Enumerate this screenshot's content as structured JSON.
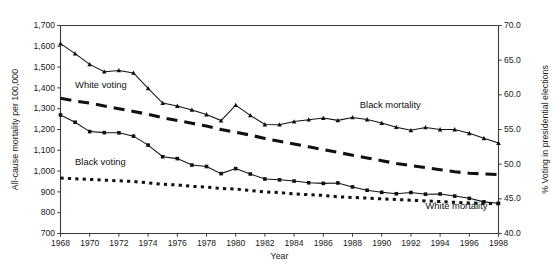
{
  "chart_data": {
    "type": "line",
    "title": "",
    "xlabel": "Year",
    "ylabel": "All-cause mortality per 100,000",
    "y2label": "% Voting in presidential elections",
    "xlim": [
      1968,
      1998
    ],
    "ylim": [
      700,
      1700
    ],
    "y2lim": [
      40.0,
      70.0
    ],
    "grid": false,
    "legend_position": "inline-annotations",
    "x_ticks": [
      1968,
      1970,
      1972,
      1974,
      1976,
      1978,
      1980,
      1982,
      1984,
      1986,
      1988,
      1990,
      1992,
      1994,
      1996,
      1998
    ],
    "x_tick_labels": [
      "1968",
      "1970",
      "1972",
      "1974",
      "1976",
      "1978",
      "1980",
      "1982",
      "1984",
      "1986",
      "1988",
      "1990",
      "1992",
      "1994",
      "1996",
      "1998"
    ],
    "y_ticks": [
      700,
      800,
      900,
      1000,
      1100,
      1200,
      1300,
      1400,
      1500,
      1600,
      1700
    ],
    "y_tick_labels": [
      "700",
      "800",
      "900",
      "1,000",
      "1,100",
      "1,200",
      "1,300",
      "1,400",
      "1,500",
      "1,600",
      "1,700"
    ],
    "y2_ticks": [
      40.0,
      45.0,
      50.0,
      55.0,
      60.0,
      65.0,
      70.0
    ],
    "y2_tick_labels": [
      "40.0",
      "45.0",
      "50.0",
      "55.0",
      "60.0",
      "65.0",
      "70.0"
    ],
    "x": [
      1968,
      1969,
      1970,
      1971,
      1972,
      1973,
      1974,
      1975,
      1976,
      1977,
      1978,
      1979,
      1980,
      1981,
      1982,
      1983,
      1984,
      1985,
      1986,
      1987,
      1988,
      1989,
      1990,
      1991,
      1992,
      1993,
      1994,
      1995,
      1996,
      1997,
      1998
    ],
    "series": [
      {
        "name": "Black mortality",
        "axis": "left",
        "style": "solid-with-triangle-markers",
        "marker": "triangle",
        "color": "#111111",
        "values": [
          1613,
          1565,
          1513,
          1478,
          1484,
          1472,
          1398,
          1327,
          1313,
          1294,
          1272,
          1243,
          1317,
          1268,
          1224,
          1223,
          1238,
          1247,
          1255,
          1244,
          1258,
          1248,
          1231,
          1211,
          1196,
          1210,
          1200,
          1200,
          1182,
          1158,
          1135
        ]
      },
      {
        "name": "White mortality",
        "axis": "left",
        "style": "solid-with-square-markers",
        "marker": "square",
        "color": "#111111",
        "values": [
          1270,
          1235,
          1190,
          1185,
          1184,
          1168,
          1125,
          1069,
          1060,
          1029,
          1022,
          988,
          1012,
          986,
          962,
          958,
          952,
          944,
          941,
          943,
          924,
          908,
          898,
          891,
          897,
          889,
          890,
          880,
          869,
          852,
          845
        ]
      },
      {
        "name": "White voting",
        "axis": "right",
        "style": "dashed",
        "marker": "none",
        "values": [
          59.5,
          59.1,
          58.8,
          58.4,
          58.0,
          57.6,
          57.2,
          56.7,
          56.3,
          55.9,
          55.5,
          55.0,
          54.6,
          54.2,
          53.7,
          53.3,
          52.9,
          52.5,
          52.1,
          51.7,
          51.3,
          50.9,
          50.5,
          50.1,
          49.8,
          49.5,
          49.2,
          48.9,
          48.7,
          48.6,
          48.5
        ]
      },
      {
        "name": "Black voting",
        "axis": "right",
        "style": "dotted",
        "marker": "none",
        "values": [
          48.0,
          47.9,
          47.8,
          47.7,
          47.6,
          47.5,
          47.3,
          47.1,
          47.0,
          46.8,
          46.7,
          46.5,
          46.4,
          46.2,
          46.0,
          45.9,
          45.7,
          45.6,
          45.5,
          45.3,
          45.2,
          45.1,
          45.0,
          44.9,
          44.8,
          44.7,
          44.6,
          44.5,
          44.4,
          44.35,
          44.3
        ]
      }
    ],
    "annotations": [
      {
        "text": "White voting",
        "x": 1969.0,
        "y_axis": "right",
        "y": 61.0
      },
      {
        "text": "Black voting",
        "x": 1969.0,
        "y_axis": "right",
        "y": 49.9
      },
      {
        "text": "Black mortality",
        "x": 1988.5,
        "y_axis": "left",
        "y": 1305
      },
      {
        "text": "White mortality",
        "x": 1993.0,
        "y_axis": "left",
        "y": 818
      }
    ]
  },
  "axes": {
    "left_title": "All-cause mortality per 100,000",
    "right_title": "% Voting in presidential elections",
    "bottom_title": "Year"
  },
  "labels": {
    "white_voting": "White voting",
    "black_voting": "Black voting",
    "black_mortality": "Black mortality",
    "white_mortality": "White mortality"
  }
}
